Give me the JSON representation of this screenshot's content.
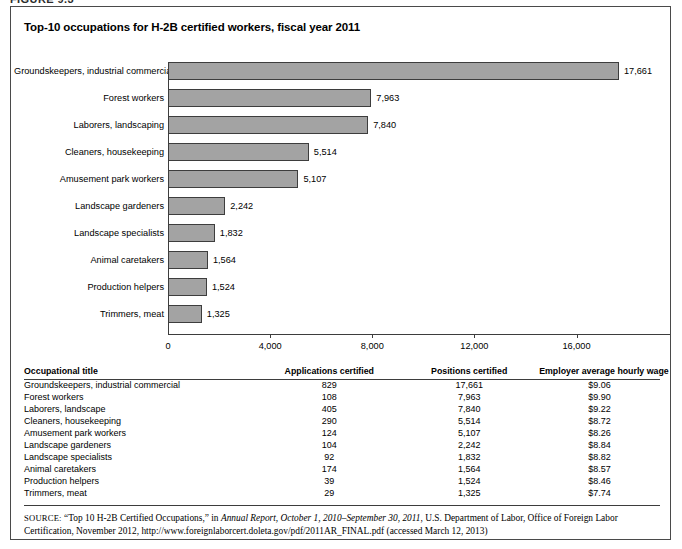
{
  "figure_caption_sliver": "FIGURE 9.3",
  "figure": {
    "title": "Top-10 occupations for H-2B certified workers, fiscal year 2011"
  },
  "chart_data": {
    "type": "bar",
    "orientation": "horizontal",
    "title": "Top-10 occupations for H-2B certified workers, fiscal year 2011",
    "xlabel": "",
    "ylabel": "",
    "xlim": [
      0,
      18800
    ],
    "xticks": [
      0,
      4000,
      8000,
      12000,
      16000
    ],
    "xtick_labels": [
      "0",
      "4,000",
      "8,000",
      "12,000",
      "16,000"
    ],
    "grid": false,
    "legend": null,
    "categories": [
      "Groundskeepers, industrial commercial",
      "Forest workers",
      "Laborers, landscaping",
      "Cleaners, housekeeping",
      "Amusement park workers",
      "Landscape gardeners",
      "Landscape specialists",
      "Animal caretakers",
      "Production helpers",
      "Trimmers, meat"
    ],
    "values": [
      17661,
      7963,
      7840,
      5514,
      5107,
      2242,
      1832,
      1564,
      1524,
      1325
    ],
    "value_labels": [
      "17,661",
      "7,963",
      "7,840",
      "5,514",
      "5,107",
      "2,242",
      "1,832",
      "1,564",
      "1,524",
      "1,325"
    ],
    "bar_color": "#a3a3a3",
    "bar_border_color": "#3d3d3d"
  },
  "table": {
    "headers": [
      "Occupational title",
      "Applications certified",
      "Positions certified",
      "Employer average hourly wage"
    ],
    "rows": [
      [
        "Groundskeepers, industrial commercial",
        "829",
        "17,661",
        "$9.06"
      ],
      [
        "Forest workers",
        "108",
        "7,963",
        "$9.90"
      ],
      [
        "Laborers, landscape",
        "405",
        "7,840",
        "$9.22"
      ],
      [
        "Cleaners, housekeeping",
        "290",
        "5,514",
        "$8.72"
      ],
      [
        "Amusement park workers",
        "124",
        "5,107",
        "$8.26"
      ],
      [
        "Landscape gardeners",
        "104",
        "2,242",
        "$8.84"
      ],
      [
        "Landscape specialists",
        "92",
        "1,832",
        "$8.82"
      ],
      [
        "Animal caretakers",
        "174",
        "1,564",
        "$8.57"
      ],
      [
        "Production helpers",
        "39",
        "1,524",
        "$8.46"
      ],
      [
        "Trimmers, meat",
        "29",
        "1,325",
        "$7.74"
      ]
    ]
  },
  "source": {
    "label": "SOURCE:",
    "part1": " “Top 10 H-2B Certified Occupations,” in ",
    "italic": "Annual Report, October 1, 2010–September 30, 2011",
    "part2": ", U.S. Department of Labor, Office of Foreign Labor Certification, November 2012, http://www.foreignlaborcert.doleta.gov/pdf/2011AR_FINAL.pdf (accessed March 12, 2013)"
  }
}
